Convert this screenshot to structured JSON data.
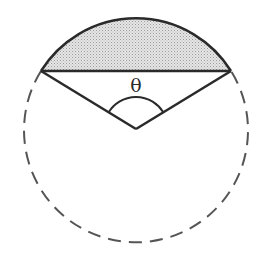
{
  "diagram": {
    "angle_label": "θ",
    "colors": {
      "stroke": "#2a2a2a",
      "segment_fill": "#d4d4d4",
      "dashed_arc": "#555555",
      "background": "#ffffff"
    },
    "geometry": {
      "center": [
        136,
        129
      ],
      "radius": 112,
      "chord_left": [
        41,
        71
      ],
      "chord_right": [
        231,
        71
      ],
      "angle_arc_radius": 32
    },
    "elements": [
      "shaded-segment",
      "solid-major-arc-top",
      "chord",
      "left-radius",
      "right-radius",
      "central-angle-arc",
      "dashed-remaining-circle"
    ]
  }
}
